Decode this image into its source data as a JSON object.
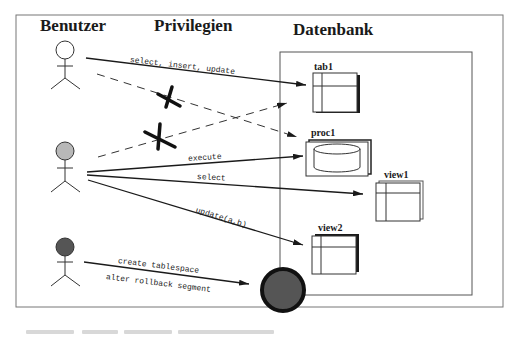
{
  "headings": {
    "users": "Benutzer",
    "privileges": "Privilegien",
    "database": "Datenbank"
  },
  "users": [
    {
      "id": "user1",
      "fill": "#ffffff",
      "head_color": "#ffffff"
    },
    {
      "id": "user2",
      "fill": "#b8b8b8",
      "head_color": "#b8b8b8"
    },
    {
      "id": "user3",
      "fill": "#555555",
      "head_color": "#555555"
    }
  ],
  "objects": {
    "tab1": "tab1",
    "proc1": "proc1",
    "view1": "view1",
    "view2": "view2"
  },
  "privileges": {
    "user1_tab1": "select, insert, update",
    "user2_proc1": "execute",
    "user2_view1": "select",
    "user2_view2": "update(a,b)",
    "user3_system_1": "create tablespace",
    "user3_system_2": "alter rollback segment"
  },
  "denied": [
    {
      "from": "user1",
      "to": "proc1"
    },
    {
      "from": "user2",
      "to": "tab1"
    }
  ],
  "colors": {
    "line": "#1a1a1a",
    "frame": "#555555",
    "system_fill": "#555555"
  }
}
